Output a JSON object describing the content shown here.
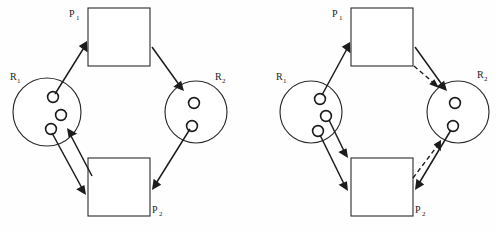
{
  "figure": {
    "background_color": "#fefefe",
    "ink_color": "#1c1c1c",
    "width": 497,
    "height": 233,
    "caption": ""
  },
  "diagrams": [
    {
      "id": "left",
      "name": "resource-allocation-graph-no-deadlock",
      "nodes": [
        {
          "id": "L-P1",
          "type": "process",
          "label": "P",
          "subscript": "1",
          "label_position": "left"
        },
        {
          "id": "L-P2",
          "type": "process",
          "label": "P",
          "subscript": "2",
          "label_position": "right"
        },
        {
          "id": "L-R1",
          "type": "resource",
          "label": "R",
          "subscript": "1",
          "instances": 3,
          "label_position": "upper-left"
        },
        {
          "id": "L-R2",
          "type": "resource",
          "label": "R",
          "subscript": "2",
          "instances": 2,
          "label_position": "upper-right"
        }
      ],
      "edges": [
        {
          "from": "L-R1",
          "to": "L-P1",
          "kind": "assignment",
          "style": "solid"
        },
        {
          "from": "L-P1",
          "to": "L-R2",
          "kind": "request",
          "style": "solid"
        },
        {
          "from": "L-R2",
          "to": "L-P2",
          "kind": "assignment",
          "style": "solid"
        },
        {
          "from": "L-R1",
          "to": "L-P2",
          "kind": "assignment",
          "style": "solid"
        },
        {
          "from": "L-P2",
          "to": "L-R1",
          "kind": "request",
          "style": "solid"
        }
      ]
    },
    {
      "id": "right",
      "name": "resource-allocation-graph-with-deadlock",
      "nodes": [
        {
          "id": "R-P1",
          "type": "process",
          "label": "P",
          "subscript": "1",
          "label_position": "left"
        },
        {
          "id": "R-P2",
          "type": "process",
          "label": "P",
          "subscript": "2",
          "label_position": "right"
        },
        {
          "id": "R-R1",
          "type": "resource",
          "label": "R",
          "subscript": "1",
          "instances": 3,
          "label_position": "upper-left"
        },
        {
          "id": "R-R2",
          "type": "resource",
          "label": "R",
          "subscript": "2",
          "instances": 2,
          "label_position": "upper-right"
        }
      ],
      "edges": [
        {
          "from": "R-R1",
          "to": "R-P1",
          "kind": "assignment",
          "style": "solid"
        },
        {
          "from": "R-P1",
          "to": "R-R2",
          "kind": "request",
          "style": "solid"
        },
        {
          "from": "R-P1",
          "to": "R-R2",
          "kind": "request-pending",
          "style": "dashed"
        },
        {
          "from": "R-R2",
          "to": "R-P2",
          "kind": "assignment",
          "style": "solid"
        },
        {
          "from": "R-P2",
          "to": "R-R2",
          "kind": "request-pending",
          "style": "dashed"
        },
        {
          "from": "R-R1",
          "to": "R-P2",
          "kind": "assignment",
          "style": "solid"
        },
        {
          "from": "R-R1",
          "to": "R-P2",
          "kind": "assignment-second",
          "style": "solid"
        }
      ]
    }
  ],
  "labels": {
    "left_p1": "P",
    "left_p1_sub": "1",
    "left_p2": "P",
    "left_p2_sub": "2",
    "left_r1": "R",
    "left_r1_sub": "1",
    "left_r2": "R",
    "left_r2_sub": "2",
    "right_p1": "P",
    "right_p1_sub": "1",
    "right_p2": "P",
    "right_p2_sub": "2",
    "right_r1": "R",
    "right_r1_sub": "1",
    "right_r2": "R",
    "right_r2_sub": "2"
  }
}
